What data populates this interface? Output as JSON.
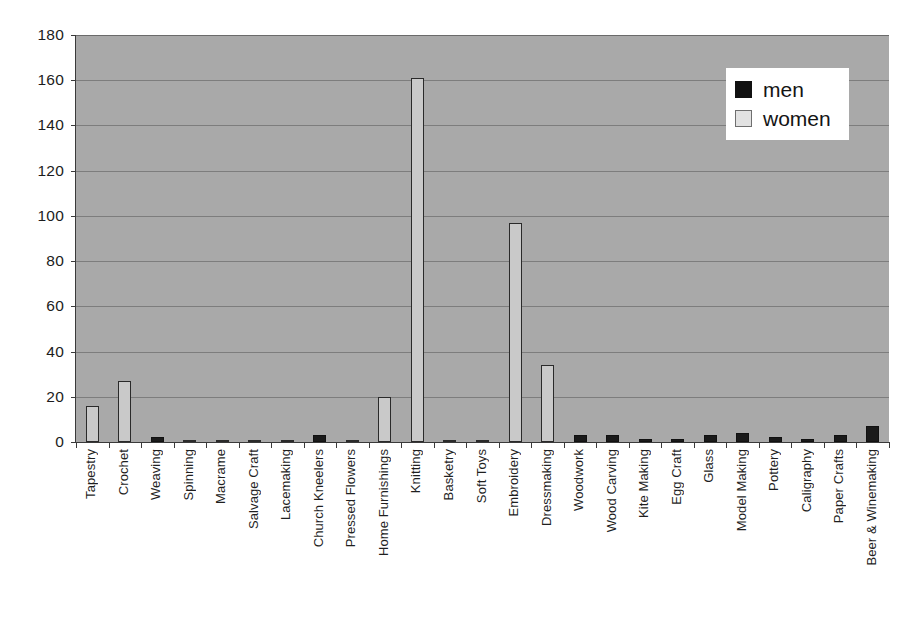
{
  "chart_data": {
    "type": "bar",
    "title": "",
    "xlabel": "",
    "ylabel": "",
    "ylim": [
      0,
      180
    ],
    "ytick_step": 20,
    "yticks": [
      0,
      20,
      40,
      60,
      80,
      100,
      120,
      140,
      160,
      180
    ],
    "grid": true,
    "legend_position": "top-right",
    "categories": [
      "Tapestry",
      "Crochet",
      "Weaving",
      "Spinning",
      "Macrame",
      "Salvage Craft",
      "Lacemaking",
      "Church Kneelers",
      "Pressed Flowers",
      "Home Furnishings",
      "Knitting",
      "Basketry",
      "Soft Toys",
      "Embroidery",
      "Dressmaking",
      "Woodwork",
      "Wood Carving",
      "Kite Making",
      "Egg Craft",
      "Glass",
      "Model Making",
      "Pottery",
      "Caligraphy",
      "Paper Crafts",
      "Beer & Winemaking"
    ],
    "series": [
      {
        "name": "men",
        "color": "#1a1a1a",
        "values": [
          0,
          0,
          2,
          0,
          0,
          0,
          0,
          3,
          0,
          0,
          0,
          0,
          0,
          0,
          0,
          3,
          3,
          1.5,
          1.5,
          3,
          4,
          2,
          1.5,
          3,
          7
        ]
      },
      {
        "name": "women",
        "color": "#c9c9c9",
        "values": [
          16,
          27,
          0,
          1,
          1,
          1,
          1,
          0,
          1,
          20,
          161,
          1,
          1,
          97,
          34,
          0,
          0,
          0,
          0,
          0,
          0,
          0,
          0,
          0,
          0
        ]
      }
    ]
  },
  "legend": {
    "items": [
      {
        "label": "men",
        "swatch": "men"
      },
      {
        "label": "women",
        "swatch": "women"
      }
    ]
  },
  "colors": {
    "plot_background": "#a9a9a9",
    "gridline": "#7d7d7d",
    "axis": "#3a3a3a",
    "men": "#1a1a1a",
    "women": "#c9c9c9",
    "page_background": "#ffffff"
  }
}
